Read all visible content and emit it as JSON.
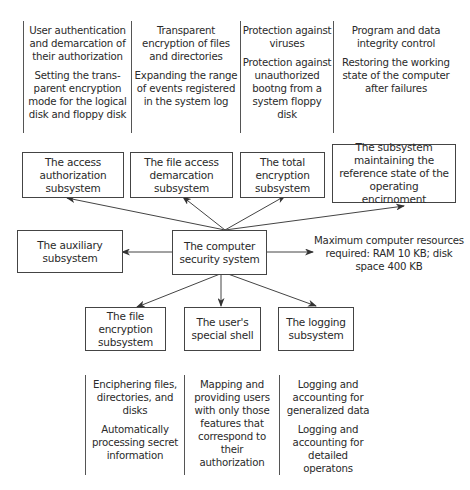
{
  "top_functions": [
    {
      "items": [
        "User authentication and demarcation of their authorization",
        "Setting the trans-parent encryption mode for the logical disk and floppy disk"
      ]
    },
    {
      "items": [
        "Transparent encryption of files and directories",
        "Expanding the range of events registered in the system log"
      ]
    },
    {
      "items": [
        "Protection against viruses",
        "Protection against unauthorized bootng from a system floppy disk"
      ]
    },
    {
      "items": [
        "Program and data integrity control",
        "Restoring the working state of the computer after failures"
      ]
    }
  ],
  "top_subsystems": [
    "The access authorization subsystem",
    "The file access demarcation subsystem",
    "The total encryption subsystem",
    "The subsystem maintaining the reference state of the operating encirnoment"
  ],
  "center": "The computer security system",
  "auxiliary": "The auxiliary subsystem",
  "resources_note": "Maximum computer resources required: RAM 10 KB; disk space 400 KB",
  "bottom_subsystems": [
    "The file encryption subsystem",
    "The user's special shell",
    "The logging subsystem"
  ],
  "bottom_functions": [
    {
      "items": [
        "Enciphering files, directories, and disks",
        "Automatically processing secret information"
      ]
    },
    {
      "items": [
        "Mapping and providing users with only those features that correspond to their authorization"
      ]
    },
    {
      "items": [
        "Logging and accounting for generalized data",
        "Logging and accounting for detailed operatons"
      ]
    }
  ],
  "colors": {
    "line": "#444444",
    "text": "#2a2a2a",
    "background": "#ffffff"
  }
}
